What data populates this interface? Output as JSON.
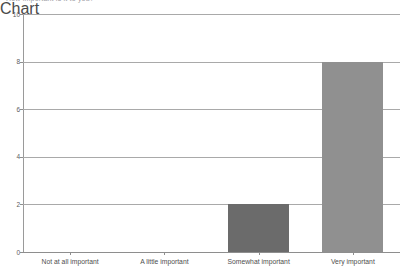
{
  "chart_data": {
    "type": "bar",
    "title": "",
    "title_fragment": "How important is it to you?",
    "xlabel": "",
    "ylabel": "",
    "categories": [
      "Not at all important",
      "A little important",
      "Somewhat important",
      "Very important"
    ],
    "values": [
      0,
      0,
      2,
      8
    ],
    "ylim": [
      0,
      10
    ],
    "ytick_labels": [
      "0",
      "2",
      "4",
      "6",
      "8",
      "10"
    ],
    "ytick_values": [
      0,
      2,
      4,
      6,
      8,
      10
    ],
    "grid": true,
    "legend": "none",
    "orientation": "vertical",
    "bar_colors": [
      "#6b6b6b",
      "#6b6b6b",
      "#6b6b6b",
      "#909090"
    ],
    "colors": {
      "background": "#ffffff",
      "gridline": "#a9a9a9",
      "axis": "#8e8e8e",
      "tick_text": "#5c5c5c",
      "label_text": "#4e4e4e",
      "bar_short": "#6b6b6b",
      "bar_tall": "#909090"
    }
  }
}
